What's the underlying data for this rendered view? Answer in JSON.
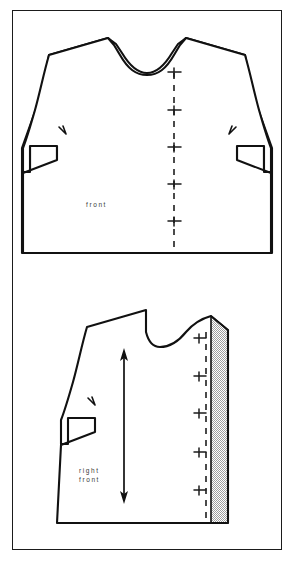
{
  "figure": {
    "kind": "sewing-pattern-diagram",
    "frame": {
      "stroke_color": "#1b1b1b",
      "background": "#ffffff"
    }
  },
  "pieces": [
    {
      "id": "full-front",
      "label": "front",
      "label_lines": [
        "front"
      ],
      "description": "full bodice front pattern piece with neckline, two shoulders, two armholes, two side darts",
      "center_front_line": {
        "style": "dashed",
        "color": "#4a4a4a",
        "marks_count": 5,
        "mark_type": "buttonhole-mark"
      },
      "notches": 2
    },
    {
      "id": "right-front",
      "label_lines": [
        "right",
        "front"
      ],
      "description": "right front half pattern piece with grainline arrow, shaded facing extension and buttonhole marks",
      "grainline": {
        "type": "double-headed-arrow",
        "color": "#111111"
      },
      "center_front_line": {
        "style": "dashed",
        "color": "#4a4a4a",
        "marks_count": 5,
        "mark_type": "buttonhole-mark"
      },
      "facing": {
        "fill": "shaded-checker-gray",
        "base_color": "#b9b9b9"
      },
      "notches": 1
    }
  ],
  "colors": {
    "outline": "#111111",
    "dashed_line": "#4a4a4a",
    "text": "#3a3a3a",
    "shading": "#b9b9b9",
    "frame": "#1b1b1b",
    "page": "#ffffff"
  }
}
